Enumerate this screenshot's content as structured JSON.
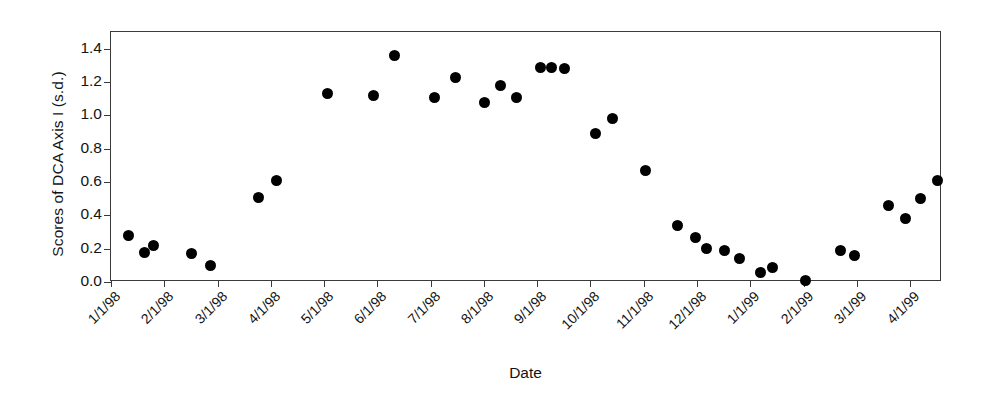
{
  "chart_data": {
    "type": "scatter",
    "title": "",
    "xlabel": "Date",
    "ylabel": "Scores of DCA Axis I (s.d.)",
    "ylim": [
      0.0,
      1.5
    ],
    "yticks": [
      "0.0",
      "0.2",
      "0.4",
      "0.6",
      "0.8",
      "1.0",
      "1.2",
      "1.4"
    ],
    "ytick_values": [
      0.0,
      0.2,
      0.4,
      0.6,
      0.8,
      1.0,
      1.2,
      1.4
    ],
    "xtick_labels": [
      "1/1/98",
      "2/1/98",
      "3/1/98",
      "4/1/98",
      "5/1/98",
      "6/1/98",
      "7/1/98",
      "8/1/98",
      "9/1/98",
      "10/1/98",
      "11/1/98",
      "12/1/98",
      "1/1/99",
      "2/1/99",
      "3/1/99",
      "4/1/99"
    ],
    "xlim": [
      0,
      15.6
    ],
    "grid": false,
    "legend": "none",
    "marker": "filled-circle",
    "marker_color": "#000000",
    "series": [
      {
        "name": "DCA Axis I scores",
        "points": [
          {
            "x": 0.32,
            "y": 0.28,
            "date": "1/11/98"
          },
          {
            "x": 0.62,
            "y": 0.18,
            "date": "1/20/98"
          },
          {
            "x": 0.8,
            "y": 0.22,
            "date": "1/25/98"
          },
          {
            "x": 1.52,
            "y": 0.17,
            "date": "2/17/98"
          },
          {
            "x": 1.86,
            "y": 0.1,
            "date": "2/27/98"
          },
          {
            "x": 2.76,
            "y": 0.51,
            "date": "3/24/98"
          },
          {
            "x": 3.1,
            "y": 0.61,
            "date": "4/4/98"
          },
          {
            "x": 4.06,
            "y": 1.13,
            "date": "5/2/98"
          },
          {
            "x": 4.92,
            "y": 1.12,
            "date": "6/1/98"
          },
          {
            "x": 5.32,
            "y": 1.36,
            "date": "6/11/98"
          },
          {
            "x": 6.08,
            "y": 1.11,
            "date": "7/3/98"
          },
          {
            "x": 6.46,
            "y": 1.23,
            "date": "7/14/98"
          },
          {
            "x": 7.02,
            "y": 1.08,
            "date": "8/1/98"
          },
          {
            "x": 7.32,
            "y": 1.18,
            "date": "8/10/98"
          },
          {
            "x": 7.62,
            "y": 1.11,
            "date": "8/19/98"
          },
          {
            "x": 8.06,
            "y": 1.29,
            "date": "9/2/98"
          },
          {
            "x": 8.26,
            "y": 1.29,
            "date": "9/8/98"
          },
          {
            "x": 8.52,
            "y": 1.28,
            "date": "9/16/98"
          },
          {
            "x": 9.1,
            "y": 0.89,
            "date": "10/3/98"
          },
          {
            "x": 9.42,
            "y": 0.98,
            "date": "10/13/98"
          },
          {
            "x": 10.04,
            "y": 0.67,
            "date": "11/1/98"
          },
          {
            "x": 10.64,
            "y": 0.34,
            "date": "11/19/98"
          },
          {
            "x": 10.98,
            "y": 0.27,
            "date": "11/29/98"
          },
          {
            "x": 11.18,
            "y": 0.2,
            "date": "12/5/98"
          },
          {
            "x": 11.52,
            "y": 0.19,
            "date": "12/15/98"
          },
          {
            "x": 11.8,
            "y": 0.14,
            "date": "12/24/98"
          },
          {
            "x": 12.2,
            "y": 0.06,
            "date": "1/6/99"
          },
          {
            "x": 12.42,
            "y": 0.09,
            "date": "1/13/99"
          },
          {
            "x": 13.04,
            "y": 0.01,
            "date": "2/1/99"
          },
          {
            "x": 13.7,
            "y": 0.19,
            "date": "2/21/99"
          },
          {
            "x": 13.96,
            "y": 0.16,
            "date": "3/1/99"
          },
          {
            "x": 14.6,
            "y": 0.46,
            "date": "3/20/99"
          },
          {
            "x": 14.92,
            "y": 0.38,
            "date": "3/30/99"
          },
          {
            "x": 15.2,
            "y": 0.5,
            "date": "4/8/99"
          },
          {
            "x": 15.52,
            "y": 0.61,
            "date": "4/17/99"
          }
        ]
      }
    ]
  }
}
